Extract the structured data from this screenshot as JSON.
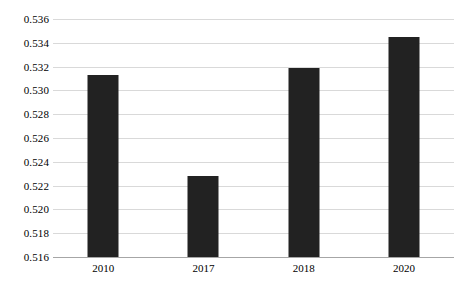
{
  "chart_data": {
    "type": "bar",
    "title": "",
    "subtitle": "",
    "xlabel": "",
    "ylabel": "",
    "categories": [
      "2010",
      "2017",
      "2018",
      "2020"
    ],
    "values": [
      0.5313,
      0.5228,
      0.5319,
      0.5345
    ],
    "series": [
      {
        "name": "",
        "values": [
          0.5313,
          0.5228,
          0.5319,
          0.5345
        ]
      }
    ],
    "ylim": [
      0.516,
      0.536
    ],
    "ytick_step": 0.002,
    "ytick_labels": [
      "0.536",
      "0.534",
      "0.532",
      "0.530",
      "0.528",
      "0.526",
      "0.524",
      "0.522",
      "0.520",
      "0.518",
      "0.516"
    ],
    "ytick_values": [
      0.536,
      0.534,
      0.532,
      0.53,
      0.528,
      0.526,
      0.524,
      0.522,
      0.52,
      0.518,
      0.516
    ],
    "grid": true,
    "grid_axis": "y",
    "legend": false,
    "legend_position": "none",
    "bar_color": "#222222",
    "grid_color": "#d9d9d9",
    "axis_color": "#a6a6a6",
    "background_color": "#ffffff",
    "annotations": []
  }
}
